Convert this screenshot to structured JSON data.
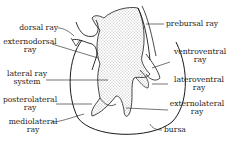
{
  "figure": {
    "type": "anatomical line drawing",
    "colors": {
      "ink": "#1a1a1a",
      "background": "#ffffff",
      "stipple": "#555555"
    }
  },
  "labels": {
    "dorsal_ray": "dorsal ray",
    "externodorsal_ray": {
      "line1": "externodorsal",
      "line2": "ray"
    },
    "lateral_ray_system": {
      "line1": "lateral ray",
      "line2": "system"
    },
    "posterolateral_ray": {
      "line1": "posterolateral",
      "line2": "ray"
    },
    "mediolateral_ray": {
      "line1": "mediolateral",
      "line2": "ray"
    },
    "prebursal_ray": "prebursal ray",
    "ventroventral_ray": {
      "line1": "ventroventral",
      "line2": "ray"
    },
    "lateroventral_ray": {
      "line1": "lateroventral",
      "line2": "ray"
    },
    "externolateral_ray": {
      "line1": "externolateral",
      "line2": "ray"
    },
    "bursa": "bursa"
  }
}
